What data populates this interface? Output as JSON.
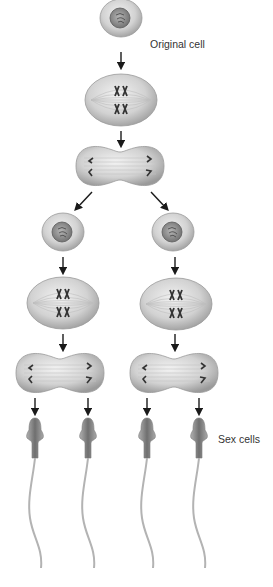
{
  "labels": {
    "original_cell": "Original cell",
    "sex_cells": "Sex cells"
  },
  "colors": {
    "cell_fill_light": "#e6e6e6",
    "cell_fill_dark": "#9c9c9c",
    "nucleus": "#7a7a7a",
    "chromosome": "#333333",
    "arrow": "#1a1a1a",
    "sperm_head": "#8a8a8a",
    "tail": "#b0b0b0"
  },
  "stages": [
    {
      "name": "original-cell",
      "count": 1
    },
    {
      "name": "meiosis-1-metaphase",
      "count": 1
    },
    {
      "name": "meiosis-1-anaphase",
      "count": 1
    },
    {
      "name": "daughter-cells",
      "count": 2
    },
    {
      "name": "meiosis-2-metaphase",
      "count": 2
    },
    {
      "name": "meiosis-2-anaphase",
      "count": 2
    },
    {
      "name": "sex-cells",
      "count": 4
    }
  ]
}
